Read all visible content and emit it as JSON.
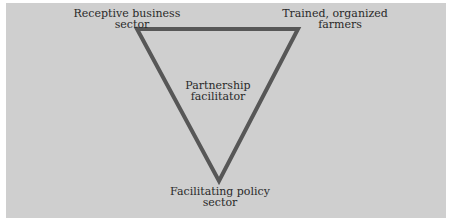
{
  "diagram": {
    "type": "triangle",
    "colors": {
      "background": "#cfcfcf",
      "line": "#575757",
      "text": "#2a2a2a"
    },
    "vertices": {
      "top_left": {
        "line1": "Receptive business",
        "line2": "sector"
      },
      "top_right": {
        "line1": "Trained, organized",
        "line2": "farmers"
      },
      "bottom": {
        "line1": "Facilitating policy",
        "line2": "sector"
      }
    },
    "center": {
      "line1": "Partnership",
      "line2": "facilitator"
    }
  }
}
